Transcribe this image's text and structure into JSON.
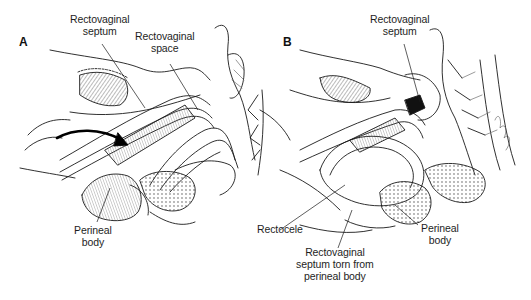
{
  "figure": {
    "panels": [
      {
        "id": "A",
        "letter": "A",
        "labels": [
          {
            "id": "rv-septum-a",
            "lines": [
              "Rectovaginal",
              "septum"
            ]
          },
          {
            "id": "rv-space-a",
            "lines": [
              "Rectovaginal",
              "space"
            ]
          },
          {
            "id": "perineal-body-a",
            "lines": [
              "Perineal",
              "body"
            ]
          }
        ]
      },
      {
        "id": "B",
        "letter": "B",
        "labels": [
          {
            "id": "rv-septum-b",
            "lines": [
              "Rectovaginal",
              "septum"
            ]
          },
          {
            "id": "rectocele-b",
            "lines": [
              "Rectocele"
            ]
          },
          {
            "id": "perineal-body-b",
            "lines": [
              "Perineal",
              "body"
            ]
          },
          {
            "id": "septum-torn-b",
            "lines": [
              "Rectovaginal",
              "septum torn from",
              "perineal body"
            ]
          }
        ]
      }
    ],
    "colors": {
      "ink": "#1a1a1a",
      "background": "#ffffff",
      "hatch": "#555555"
    }
  }
}
